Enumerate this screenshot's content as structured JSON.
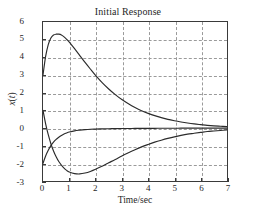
{
  "chart_data": {
    "type": "line",
    "title": "Initial Response",
    "xlabel": "Time/sec",
    "ylabel": "x(t)",
    "xlim": [
      0,
      7
    ],
    "ylim": [
      -3,
      6
    ],
    "grid": true,
    "legend": "none",
    "xticks": [
      "0",
      "1",
      "2",
      "3",
      "4",
      "5",
      "6",
      "7"
    ],
    "yticks": [
      "6",
      "5",
      "4",
      "3",
      "2",
      "1",
      "0",
      "-1",
      "-2",
      "-3"
    ],
    "xtick_values": [
      0,
      1,
      2,
      3,
      4,
      5,
      6,
      7
    ],
    "ytick_values": [
      6,
      5,
      4,
      3,
      2,
      1,
      0,
      -1,
      -2,
      -3
    ],
    "line_color": "#2b2b2b",
    "grid_color": "#9a9a9a",
    "axis_color": "#3a3a3a",
    "background": "#ffffff",
    "x": [
      0,
      0.1,
      0.2,
      0.3,
      0.4,
      0.5,
      0.6,
      0.7,
      0.8,
      0.9,
      1.0,
      1.2,
      1.4,
      1.6,
      1.8,
      2.0,
      2.25,
      2.5,
      2.75,
      3.0,
      3.25,
      3.5,
      3.75,
      4.0,
      4.25,
      4.5,
      4.75,
      5.0,
      5.25,
      5.5,
      5.75,
      6.0,
      6.25,
      6.5,
      6.75,
      7.0
    ],
    "series": [
      {
        "name": "state-1",
        "initial_value": 3.0,
        "peak": {
          "t": 0.65,
          "value": 5.3
        },
        "values": [
          3.0,
          4.05,
          4.72,
          5.09,
          5.26,
          5.31,
          5.31,
          5.27,
          5.16,
          5.02,
          4.86,
          4.49,
          4.1,
          3.71,
          3.34,
          2.98,
          2.57,
          2.21,
          1.89,
          1.61,
          1.37,
          1.16,
          0.98,
          0.83,
          0.7,
          0.59,
          0.49,
          0.41,
          0.34,
          0.28,
          0.23,
          0.19,
          0.15,
          0.12,
          0.1,
          0.08
        ]
      },
      {
        "name": "state-2",
        "initial_value": 1.0,
        "minimum": {
          "t": 1.05,
          "value": -2.6
        },
        "values": [
          1.0,
          0.24,
          -0.38,
          -0.89,
          -1.3,
          -1.63,
          -1.9,
          -2.1,
          -2.27,
          -2.4,
          -2.49,
          -2.58,
          -2.6,
          -2.55,
          -2.46,
          -2.34,
          -2.16,
          -1.97,
          -1.78,
          -1.58,
          -1.4,
          -1.23,
          -1.07,
          -0.93,
          -0.8,
          -0.69,
          -0.59,
          -0.5,
          -0.42,
          -0.35,
          -0.3,
          -0.25,
          -0.2,
          -0.17,
          -0.14,
          -0.11
        ]
      },
      {
        "name": "state-3",
        "initial_value": -2.0,
        "values": [
          -2.0,
          -1.58,
          -1.26,
          -1.0,
          -0.8,
          -0.64,
          -0.52,
          -0.42,
          -0.34,
          -0.28,
          -0.23,
          -0.16,
          -0.12,
          -0.09,
          -0.07,
          -0.06,
          -0.05,
          -0.04,
          -0.035,
          -0.03,
          -0.027,
          -0.024,
          -0.021,
          -0.019,
          -0.017,
          -0.015,
          -0.013,
          -0.012,
          -0.011,
          -0.01,
          -0.009,
          -0.008,
          -0.007,
          -0.006,
          -0.005,
          -0.005
        ]
      }
    ]
  }
}
